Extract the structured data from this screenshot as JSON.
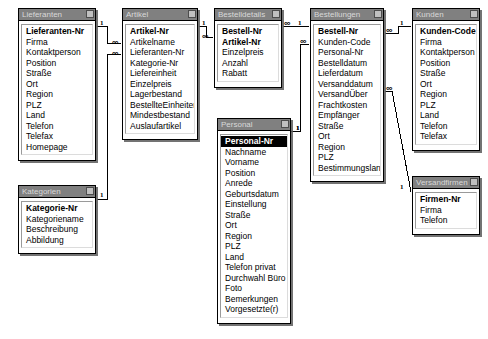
{
  "window": {
    "title": "Beziehungen"
  },
  "tables": [
    {
      "id": "lieferanten",
      "title": "Lieferanten",
      "x": 18,
      "y": 8,
      "w": 78,
      "h": 153,
      "fields": [
        {
          "name": "Lieferanten-Nr",
          "key": true
        },
        {
          "name": "Firma"
        },
        {
          "name": "Kontaktperson"
        },
        {
          "name": "Position"
        },
        {
          "name": "Straße"
        },
        {
          "name": "Ort"
        },
        {
          "name": "Region"
        },
        {
          "name": "PLZ"
        },
        {
          "name": "Land"
        },
        {
          "name": "Telefon"
        },
        {
          "name": "Telefax"
        },
        {
          "name": "Homepage"
        }
      ]
    },
    {
      "id": "artikel",
      "title": "Artikel",
      "x": 122,
      "y": 8,
      "w": 76,
      "h": 142,
      "fields": [
        {
          "name": "Artikel-Nr",
          "key": true
        },
        {
          "name": "Artikelname"
        },
        {
          "name": "Lieferanten-Nr"
        },
        {
          "name": "Kategorie-Nr"
        },
        {
          "name": "Liefereinheit"
        },
        {
          "name": "Einzelpreis"
        },
        {
          "name": "Lagerbestand"
        },
        {
          "name": "BestellteEinheiten"
        },
        {
          "name": "Mindestbestand"
        },
        {
          "name": "Auslaufartikel"
        }
      ]
    },
    {
      "id": "bestelldetails",
      "title": "Bestelldetails",
      "x": 214,
      "y": 8,
      "w": 68,
      "h": 82,
      "fields": [
        {
          "name": "Bestell-Nr",
          "key": true
        },
        {
          "name": "Artikel-Nr",
          "key": true
        },
        {
          "name": "Einzelpreis"
        },
        {
          "name": "Anzahl"
        },
        {
          "name": "Rabatt"
        }
      ]
    },
    {
      "id": "bestellungen",
      "title": "Bestellungen",
      "x": 310,
      "y": 8,
      "w": 74,
      "h": 172,
      "fields": [
        {
          "name": "Bestell-Nr",
          "key": true
        },
        {
          "name": "Kunden-Code"
        },
        {
          "name": "Personal-Nr"
        },
        {
          "name": "Bestelldatum"
        },
        {
          "name": "Lieferdatum"
        },
        {
          "name": "Versanddatum"
        },
        {
          "name": "VersandÜber"
        },
        {
          "name": "Frachtkosten"
        },
        {
          "name": "Empfänger"
        },
        {
          "name": "Straße"
        },
        {
          "name": "Ort"
        },
        {
          "name": "Region"
        },
        {
          "name": "PLZ"
        },
        {
          "name": "Bestimmungsland"
        }
      ]
    },
    {
      "id": "kunden",
      "title": "Kunden",
      "x": 412,
      "y": 8,
      "w": 68,
      "h": 153,
      "fields": [
        {
          "name": "Kunden-Code",
          "key": true
        },
        {
          "name": "Firma"
        },
        {
          "name": "Kontaktperson"
        },
        {
          "name": "Position"
        },
        {
          "name": "Straße"
        },
        {
          "name": "Ort"
        },
        {
          "name": "Region"
        },
        {
          "name": "PLZ"
        },
        {
          "name": "Land"
        },
        {
          "name": "Telefon"
        },
        {
          "name": "Telefax"
        }
      ]
    },
    {
      "id": "kategorien",
      "title": "Kategorien",
      "x": 18,
      "y": 185,
      "w": 78,
      "h": 67,
      "fields": [
        {
          "name": "Kategorie-Nr",
          "key": true
        },
        {
          "name": "Kategoriename"
        },
        {
          "name": "Beschreibung"
        },
        {
          "name": "Abbildung"
        }
      ]
    },
    {
      "id": "personal",
      "title": "Personal",
      "x": 217,
      "y": 118,
      "w": 74,
      "h": 190,
      "fields": [
        {
          "name": "Personal-Nr",
          "key": true,
          "selected": true
        },
        {
          "name": "Nachname"
        },
        {
          "name": "Vorname"
        },
        {
          "name": "Position"
        },
        {
          "name": "Anrede"
        },
        {
          "name": "Geburtsdatum"
        },
        {
          "name": "Einstellung"
        },
        {
          "name": "Straße"
        },
        {
          "name": "Ort"
        },
        {
          "name": "Region"
        },
        {
          "name": "PLZ"
        },
        {
          "name": "Land"
        },
        {
          "name": "Telefon privat"
        },
        {
          "name": "Durchwahl Büro"
        },
        {
          "name": "Foto"
        },
        {
          "name": "Bemerkungen"
        },
        {
          "name": "Vorgesetzte(r)"
        }
      ]
    },
    {
      "id": "versandfirmen",
      "title": "Versandfirmen",
      "x": 412,
      "y": 176,
      "w": 68,
      "h": 53,
      "fields": [
        {
          "name": "Firmen-Nr",
          "key": true
        },
        {
          "name": "Firma"
        },
        {
          "name": "Telefon"
        }
      ]
    }
  ],
  "relationships": [
    {
      "id": "lieferanten-artikel",
      "from": "Lieferanten.Lieferanten-Nr",
      "to": "Artikel.Lieferanten-Nr",
      "one_label": "1",
      "many_label": "∞",
      "one_x": 100,
      "one_y": 20,
      "many_x": 112,
      "many_y": 39,
      "path": "M 97,26 L 107,26 L 107,43 L 121,43"
    },
    {
      "id": "kategorien-artikel",
      "from": "Kategorien.Kategorie-Nr",
      "to": "Artikel.Kategorie-Nr",
      "one_label": "1",
      "many_label": "∞",
      "one_x": 100,
      "one_y": 192,
      "many_x": 112,
      "many_y": 50,
      "path": "M 97,199 L 107,199 L 107,54 L 121,54"
    },
    {
      "id": "artikel-bestelldetails",
      "from": "Artikel.Artikel-Nr",
      "to": "Bestelldetails.Artikel-Nr",
      "one_label": "1",
      "many_label": "∞",
      "one_x": 202,
      "one_y": 20,
      "many_x": 202,
      "many_y": 33,
      "path": "M 199,26 L 206,26 L 206,37 L 213,37"
    },
    {
      "id": "bestellungen-bestelldetails",
      "from": "Bestellungen.Bestell-Nr",
      "to": "Bestelldetails.Bestell-Nr",
      "one_label": "1",
      "many_label": "∞",
      "one_x": 298,
      "one_y": 20,
      "many_x": 284,
      "many_y": 20,
      "path": "M 283,26 L 309,26"
    },
    {
      "id": "kunden-bestellungen",
      "from": "Kunden.Kunden-Code",
      "to": "Bestellungen.Kunden-Code",
      "one_label": "1",
      "many_label": "∞",
      "one_x": 400,
      "one_y": 20,
      "many_x": 386,
      "many_y": 27,
      "path": "M 385,33 L 398,33 L 398,26 L 411,26"
    },
    {
      "id": "personal-bestellungen",
      "from": "Personal.Personal-Nr",
      "to": "Bestellungen.Personal-Nr",
      "one_label": "1",
      "many_label": "∞",
      "one_x": 296,
      "one_y": 125,
      "many_x": 300,
      "many_y": 38,
      "path": "M 290,131 L 300,131 L 300,44 L 309,44"
    },
    {
      "id": "versandfirmen-bestellungen",
      "from": "Versandfirmen.Firmen-Nr",
      "to": "Bestellungen.VersandÜber",
      "one_label": "1",
      "many_label": "∞",
      "one_x": 400,
      "one_y": 184,
      "many_x": 386,
      "many_y": 85,
      "path": "M 385,91 L 392,91 L 411,192"
    },
    {
      "id": "personal-personal",
      "from": "Personal.Personal-Nr",
      "to": "Personal.Vorgesetzte(r)",
      "one_label": "1",
      "many_label": "",
      "one_x": 296,
      "one_y": 125,
      "many_x": 0,
      "many_y": 0,
      "path": ""
    }
  ],
  "colors": {
    "title_bar": "#808080",
    "title_text": "#d9d9d9",
    "background": "#ffffff",
    "border": "#000000",
    "shadow": "#5a5a5a",
    "selection": "#000000",
    "selection_text": "#ffffff"
  }
}
